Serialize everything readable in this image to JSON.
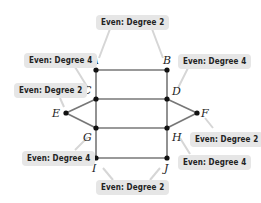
{
  "diagram": {
    "vertices": [
      {
        "id": "A",
        "label": "A",
        "x": 96,
        "y": 70
      },
      {
        "id": "B",
        "label": "B",
        "x": 167,
        "y": 70
      },
      {
        "id": "C",
        "label": "C",
        "x": 96,
        "y": 99
      },
      {
        "id": "D",
        "label": "D",
        "x": 167,
        "y": 99
      },
      {
        "id": "E",
        "label": "E",
        "x": 66,
        "y": 113
      },
      {
        "id": "F",
        "label": "F",
        "x": 197,
        "y": 113
      },
      {
        "id": "G",
        "label": "G",
        "x": 96,
        "y": 128
      },
      {
        "id": "H",
        "label": "H",
        "x": 167,
        "y": 128
      },
      {
        "id": "I",
        "label": "I",
        "x": 96,
        "y": 158
      },
      {
        "id": "J",
        "label": "J",
        "x": 167,
        "y": 158
      }
    ],
    "edges": [
      [
        "A",
        "B"
      ],
      [
        "A",
        "C"
      ],
      [
        "B",
        "D"
      ],
      [
        "C",
        "D"
      ],
      [
        "C",
        "E"
      ],
      [
        "C",
        "G"
      ],
      [
        "D",
        "F"
      ],
      [
        "D",
        "H"
      ],
      [
        "E",
        "G"
      ],
      [
        "F",
        "H"
      ],
      [
        "G",
        "H"
      ],
      [
        "G",
        "I"
      ],
      [
        "H",
        "J"
      ],
      [
        "I",
        "J"
      ]
    ],
    "callouts": [
      {
        "id": "top",
        "text": "Even: Degree 2",
        "targets": [
          "A",
          "B"
        ]
      },
      {
        "id": "A",
        "text": "Even: Degree 4",
        "targets": [
          "C"
        ]
      },
      {
        "id": "E",
        "text": "Even: Degree 2",
        "targets": [
          "E"
        ]
      },
      {
        "id": "B",
        "text": "Even: Degree 4",
        "targets": [
          "D"
        ]
      },
      {
        "id": "F",
        "text": "Even: Degree 2",
        "targets": [
          "F"
        ]
      },
      {
        "id": "G",
        "text": "Even: Degree 4",
        "targets": [
          "G"
        ]
      },
      {
        "id": "J",
        "text": "Even: Degree 4",
        "targets": [
          "H"
        ]
      },
      {
        "id": "bottom",
        "text": "Even: Degree 2",
        "targets": [
          "I",
          "J"
        ]
      }
    ],
    "colors": {
      "edge": "#777777",
      "vertex": "#111111",
      "callout_bg": "#e6e6e6",
      "leader": "#d8d8d8"
    }
  }
}
